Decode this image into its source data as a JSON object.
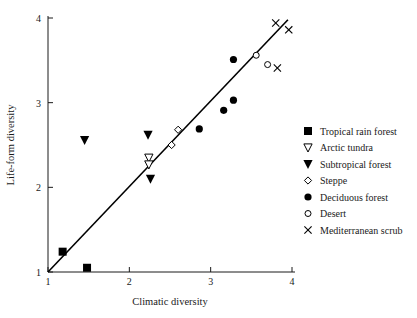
{
  "chart_data": {
    "type": "scatter",
    "title": "",
    "xlabel": "Climatic diversity",
    "ylabel": "Life-form diversity",
    "xlim": [
      1,
      4
    ],
    "ylim": [
      1,
      4
    ],
    "xticks": [
      "1",
      "2",
      "3",
      "4"
    ],
    "yticks": [
      "1",
      "2",
      "3",
      "4"
    ],
    "xtick_values": [
      1,
      2,
      3,
      4
    ],
    "ytick_values": [
      1,
      2,
      3,
      4
    ],
    "grid": false,
    "legend_position": "right",
    "trend_line": {
      "label": "1:1 reference line",
      "x": [
        1.0,
        3.95
      ],
      "y": [
        1.0,
        3.98
      ]
    },
    "series": [
      {
        "name": "Tropical rain forest",
        "marker": "filled-square",
        "points": [
          {
            "x": 1.18,
            "y": 1.24
          },
          {
            "x": 1.48,
            "y": 1.05
          }
        ]
      },
      {
        "name": "Arctic tundra",
        "marker": "open-triangle-down",
        "points": [
          {
            "x": 2.24,
            "y": 2.35
          },
          {
            "x": 2.24,
            "y": 2.27
          }
        ]
      },
      {
        "name": "Subtropical forest",
        "marker": "filled-triangle-down",
        "points": [
          {
            "x": 1.45,
            "y": 2.56
          },
          {
            "x": 2.23,
            "y": 2.62
          },
          {
            "x": 2.26,
            "y": 2.1
          }
        ]
      },
      {
        "name": "Steppe",
        "marker": "open-diamond",
        "points": [
          {
            "x": 2.52,
            "y": 2.5
          },
          {
            "x": 2.6,
            "y": 2.68
          }
        ]
      },
      {
        "name": "Deciduous forest",
        "marker": "filled-circle",
        "points": [
          {
            "x": 2.86,
            "y": 2.69
          },
          {
            "x": 3.16,
            "y": 2.91
          },
          {
            "x": 3.28,
            "y": 3.03
          },
          {
            "x": 3.28,
            "y": 3.51
          }
        ]
      },
      {
        "name": "Desert",
        "marker": "open-circle",
        "points": [
          {
            "x": 3.56,
            "y": 3.56
          },
          {
            "x": 3.7,
            "y": 3.45
          }
        ]
      },
      {
        "name": "Mediterranean scrub",
        "marker": "x-cross",
        "points": [
          {
            "x": 3.8,
            "y": 3.94
          },
          {
            "x": 3.96,
            "y": 3.86
          },
          {
            "x": 3.82,
            "y": 3.41
          }
        ]
      }
    ]
  },
  "legend": {
    "items": [
      {
        "label": "Tropical rain forest",
        "marker": "filled-square"
      },
      {
        "label": "Arctic tundra",
        "marker": "open-triangle-down"
      },
      {
        "label": "Subtropical forest",
        "marker": "filled-triangle-down"
      },
      {
        "label": "Steppe",
        "marker": "open-diamond"
      },
      {
        "label": "Deciduous forest",
        "marker": "filled-circle"
      },
      {
        "label": "Desert",
        "marker": "open-circle"
      },
      {
        "label": "Mediterranean scrub",
        "marker": "x-cross"
      }
    ]
  },
  "colors": {
    "ink": "#1a1a1a",
    "marker": "#000000",
    "background": "#ffffff"
  }
}
